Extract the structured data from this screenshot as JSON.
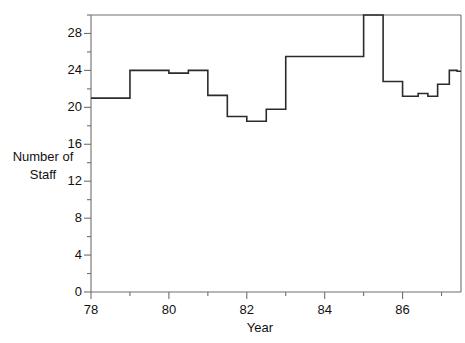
{
  "chart_data": {
    "type": "line",
    "subtype": "step",
    "title": "",
    "xlabel": "Year",
    "ylabel": "Number of Staff",
    "ylabel_lines": [
      "Number of",
      "Staff"
    ],
    "xlim": [
      78,
      87.5
    ],
    "ylim": [
      0,
      30
    ],
    "grid": false,
    "legend": null,
    "x_major_ticks": [
      78,
      80,
      82,
      84,
      86
    ],
    "x_major_tick_labels": [
      "78",
      "80",
      "82",
      "84",
      "86"
    ],
    "x_minor_ticks": [
      79,
      81,
      83,
      85,
      87
    ],
    "y_major_ticks": [
      0,
      4,
      8,
      12,
      16,
      20,
      24,
      28
    ],
    "y_major_tick_labels": [
      "0",
      "4",
      "8",
      "12",
      "16",
      "20",
      "24",
      "28"
    ],
    "y_minor_ticks": [
      2,
      6,
      10,
      14,
      18,
      22,
      26,
      30
    ],
    "line_color": "#2b2b2b",
    "line_width": 1.6,
    "axis_color": "#6f6f6f",
    "steps": [
      {
        "x_start": 78.0,
        "x_end": 79.0,
        "value": 21.0
      },
      {
        "x_start": 79.0,
        "x_end": 80.0,
        "value": 24.0
      },
      {
        "x_start": 80.0,
        "x_end": 80.5,
        "value": 23.7
      },
      {
        "x_start": 80.5,
        "x_end": 81.0,
        "value": 24.0
      },
      {
        "x_start": 81.0,
        "x_end": 81.5,
        "value": 21.3
      },
      {
        "x_start": 81.5,
        "x_end": 82.0,
        "value": 19.0
      },
      {
        "x_start": 82.0,
        "x_end": 82.5,
        "value": 18.5
      },
      {
        "x_start": 82.5,
        "x_end": 83.0,
        "value": 19.8
      },
      {
        "x_start": 83.0,
        "x_end": 83.0,
        "value": 20.0
      },
      {
        "x_start": 83.0,
        "x_end": 85.0,
        "value": 25.5
      },
      {
        "x_start": 85.0,
        "x_end": 85.5,
        "value": 30.0
      },
      {
        "x_start": 85.5,
        "x_end": 86.0,
        "value": 22.8
      },
      {
        "x_start": 86.0,
        "x_end": 86.4,
        "value": 21.2
      },
      {
        "x_start": 86.4,
        "x_end": 86.65,
        "value": 21.5
      },
      {
        "x_start": 86.65,
        "x_end": 86.9,
        "value": 21.2
      },
      {
        "x_start": 86.9,
        "x_end": 87.2,
        "value": 22.5
      },
      {
        "x_start": 87.2,
        "x_end": 87.4,
        "value": 24.0
      },
      {
        "x_start": 87.4,
        "x_end": 87.5,
        "value": 23.9
      }
    ],
    "x_values": [
      78.0,
      79.0,
      80.0,
      80.5,
      81.0,
      81.5,
      82.0,
      82.5,
      83.0,
      85.0,
      85.5,
      86.0,
      86.4,
      86.65,
      86.9,
      87.2,
      87.4,
      87.5
    ],
    "y_values": [
      21.0,
      24.0,
      23.7,
      24.0,
      21.3,
      19.0,
      18.5,
      19.8,
      25.5,
      30.0,
      22.8,
      21.2,
      21.5,
      21.2,
      22.5,
      24.0,
      23.9,
      23.9
    ]
  }
}
